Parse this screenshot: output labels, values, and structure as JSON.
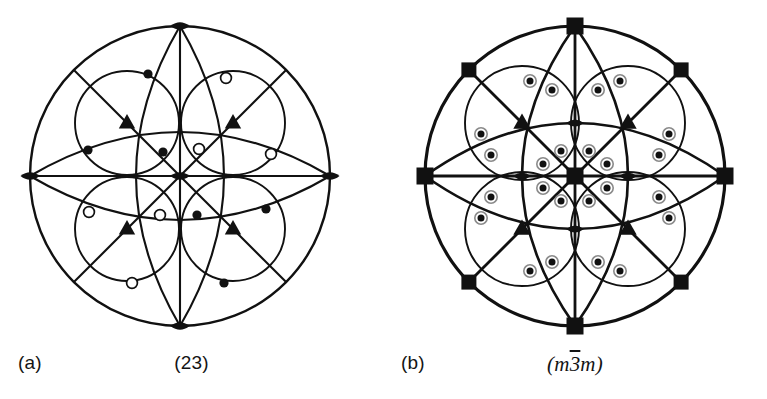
{
  "figure": {
    "background": "#ffffff",
    "ink": "#111111",
    "panels": [
      {
        "letter": "(a)",
        "symbol": "(23)",
        "symbol_italic": false,
        "point_group": "23",
        "description": "stereographic projection of point group 23",
        "center": {
          "x": 180,
          "y": 176
        },
        "radius": 150,
        "symmetry_elements": {
          "center": {
            "icon": "two-fold-lens",
            "order": 2
          },
          "axial_primitive": {
            "icon": "two-fold-lens",
            "order": 2,
            "count": 4
          },
          "diagonal_interior": {
            "icon": "three-fold-triangle",
            "order": 3,
            "count": 4
          }
        },
        "general_positions": {
          "upper_marker": "filled-dot",
          "lower_marker": "open-circle",
          "count": 12,
          "quadrant_signs": [
            "filled",
            "open",
            "open",
            "filled"
          ]
        }
      },
      {
        "letter": "(b)",
        "symbol_prefix": "(m",
        "symbol_bar": "3",
        "symbol_suffix": "m)",
        "symbol": "(m3m)",
        "symbol_italic": true,
        "point_group": "m-3m",
        "description": "stereographic projection of point group m3bar m",
        "center": {
          "x": 192,
          "y": 176
        },
        "radius": 150,
        "symmetry_elements": {
          "center": {
            "icon": "four-fold-square",
            "order": 4
          },
          "axial_primitive": {
            "icon": "four-fold-square",
            "order": 4,
            "count": 4
          },
          "diagonal_primitive": {
            "icon": "two-fold-square",
            "order": 2,
            "count": 4
          },
          "diagonal_interior": {
            "icon": "three-fold-triangle",
            "order": 3,
            "count": 4
          },
          "axial_mid": {
            "icon": "two-fold-lens",
            "order": 2,
            "count": 4
          }
        },
        "general_positions": {
          "upper_marker": "filled-dot",
          "lower_marker": "open-circle",
          "coincident": true,
          "count": 48
        }
      }
    ]
  }
}
